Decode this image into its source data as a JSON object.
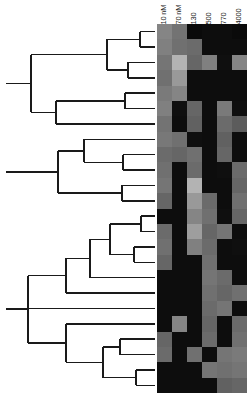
{
  "figure": {
    "type": "dendrogram-heatmap",
    "width": 247,
    "height": 393,
    "background": "#ffffff"
  },
  "columns": {
    "labels": [
      "10 nM",
      "70 nM",
      "130",
      "500",
      "770",
      "4000"
    ],
    "count": 6,
    "cell_width": 15,
    "origin_x": 157
  },
  "rows": {
    "count": 24,
    "cell_height": 15.375,
    "origin_y": 24
  },
  "dendrogram": {
    "line_color": "#1a1a1a",
    "line_width": 1.4,
    "orientation": "left-to-right",
    "leaf_count": 24
  },
  "chart_data": {
    "type": "heatmap",
    "title": "",
    "xlabel": "",
    "ylabel": "",
    "categories": [
      "10 nM",
      "70 nM",
      "130",
      "500",
      "770",
      "4000"
    ],
    "colormap": "grayscale",
    "value_range": [
      0,
      1
    ],
    "grid": false,
    "legend": "none",
    "rows": [
      {
        "name": "row-1",
        "values": [
          0.52,
          0.45,
          0.04,
          0.05,
          0.05,
          0.04
        ]
      },
      {
        "name": "row-2",
        "values": [
          0.5,
          0.44,
          0.42,
          0.05,
          0.05,
          0.05
        ]
      },
      {
        "name": "row-3",
        "values": [
          0.46,
          0.7,
          0.4,
          0.5,
          0.06,
          0.52
        ]
      },
      {
        "name": "row-4",
        "values": [
          0.44,
          0.6,
          0.05,
          0.05,
          0.05,
          0.05
        ]
      },
      {
        "name": "row-5",
        "values": [
          0.48,
          0.52,
          0.05,
          0.05,
          0.05,
          0.05
        ]
      },
      {
        "name": "row-6",
        "values": [
          0.5,
          0.06,
          0.4,
          0.05,
          0.48,
          0.06
        ]
      },
      {
        "name": "row-7",
        "values": [
          0.45,
          0.05,
          0.38,
          0.05,
          0.42,
          0.36
        ]
      },
      {
        "name": "row-8",
        "values": [
          0.47,
          0.44,
          0.06,
          0.05,
          0.38,
          0.05
        ]
      },
      {
        "name": "row-9",
        "values": [
          0.42,
          0.4,
          0.44,
          0.05,
          0.4,
          0.05
        ]
      },
      {
        "name": "row-10",
        "values": [
          0.44,
          0.05,
          0.42,
          0.05,
          0.06,
          0.42
        ]
      },
      {
        "name": "row-11",
        "values": [
          0.46,
          0.05,
          0.7,
          0.05,
          0.05,
          0.4
        ]
      },
      {
        "name": "row-12",
        "values": [
          0.4,
          0.05,
          0.6,
          0.42,
          0.05,
          0.44
        ]
      },
      {
        "name": "row-13",
        "values": [
          0.05,
          0.05,
          0.52,
          0.44,
          0.06,
          0.4
        ]
      },
      {
        "name": "row-14",
        "values": [
          0.42,
          0.05,
          0.62,
          0.4,
          0.46,
          0.05
        ]
      },
      {
        "name": "row-15",
        "values": [
          0.44,
          0.05,
          0.5,
          0.42,
          0.05,
          0.06
        ]
      },
      {
        "name": "row-16",
        "values": [
          0.4,
          0.05,
          0.05,
          0.44,
          0.05,
          0.05
        ]
      },
      {
        "name": "row-17",
        "values": [
          0.05,
          0.05,
          0.05,
          0.46,
          0.42,
          0.05
        ]
      },
      {
        "name": "row-18",
        "values": [
          0.05,
          0.05,
          0.05,
          0.44,
          0.4,
          0.44
        ]
      },
      {
        "name": "row-19",
        "values": [
          0.05,
          0.05,
          0.05,
          0.42,
          0.46,
          0.05
        ]
      },
      {
        "name": "row-20",
        "values": [
          0.05,
          0.52,
          0.05,
          0.4,
          0.05,
          0.42
        ]
      },
      {
        "name": "row-21",
        "values": [
          0.4,
          0.05,
          0.05,
          0.42,
          0.05,
          0.44
        ]
      },
      {
        "name": "row-22",
        "values": [
          0.42,
          0.05,
          0.44,
          0.05,
          0.46,
          0.48
        ]
      },
      {
        "name": "row-23",
        "values": [
          0.05,
          0.05,
          0.05,
          0.46,
          0.44,
          0.46
        ]
      },
      {
        "name": "row-24",
        "values": [
          0.05,
          0.05,
          0.05,
          0.05,
          0.38,
          0.4
        ]
      }
    ]
  }
}
